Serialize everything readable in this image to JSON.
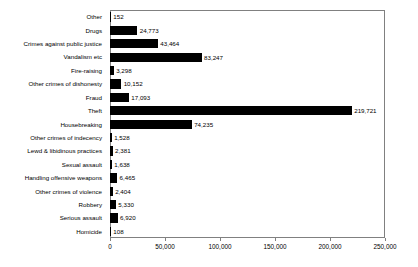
{
  "chart_data": {
    "type": "bar",
    "orientation": "horizontal",
    "title": "",
    "xlabel": "",
    "ylabel": "",
    "xlim": [
      0,
      250000
    ],
    "grid": false,
    "legend": null,
    "axis_color": "#808080",
    "bar_color": "#000000",
    "background_color": "#ffffff",
    "xticks": [
      0,
      50000,
      100000,
      150000,
      200000,
      250000
    ],
    "xtick_labels": [
      "0",
      "50,000",
      "100,000",
      "150,000",
      "200,000",
      "250,000"
    ],
    "categories": [
      "Other",
      "Drugs",
      "Crimes against public justice",
      "Vandalism etc",
      "Fire-raising",
      "Other crimes of dishonesty",
      "Fraud",
      "Theft",
      "Housebreaking",
      "Other crimes of indecency",
      "Lewd & libidinous practices",
      "Sexual assault",
      "Handling offensive weapons",
      "Other crimes of violence",
      "Robbery",
      "Serious assault",
      "Homicide"
    ],
    "values": [
      152,
      24773,
      43464,
      83247,
      3298,
      10152,
      17093,
      219721,
      74235,
      1528,
      2381,
      1638,
      6465,
      2404,
      5330,
      6920,
      108
    ],
    "value_labels": [
      "152",
      "24,773",
      "43,464",
      "83,247",
      "3,298",
      "10,152",
      "17,093",
      "219,721",
      "74,235",
      "1,528",
      "2,381",
      "1,638",
      "6,465",
      "2,404",
      "5,330",
      "6,920",
      "108"
    ]
  }
}
